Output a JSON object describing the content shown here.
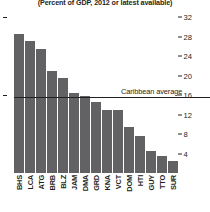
{
  "chart_data": {
    "type": "bar",
    "title": "(Percent of GDP, 2012 or latest available)",
    "xlabel": "",
    "ylabel": "",
    "ylim": [
      0,
      32
    ],
    "yticks": [
      32,
      28,
      24,
      20,
      16,
      12,
      8,
      4
    ],
    "grid": false,
    "legend": false,
    "bar_color": "#626264",
    "categories": [
      "BHS",
      "LCA",
      "ATG",
      "BRB",
      "BLZ",
      "JAM",
      "DMA",
      "GRD",
      "KNA",
      "VCT",
      "DOM",
      "HTI",
      "GUY",
      "TTO",
      "SUR"
    ],
    "values": [
      28.5,
      27.0,
      25.5,
      21.0,
      19.5,
      16.5,
      15.8,
      14.5,
      13.0,
      13.0,
      9.5,
      7.5,
      4.5,
      3.5,
      2.5
    ],
    "annotations": [
      {
        "name": "caribbean-average",
        "label": "Caribbean average",
        "value": 15.5,
        "type": "horizontal-line"
      }
    ]
  }
}
